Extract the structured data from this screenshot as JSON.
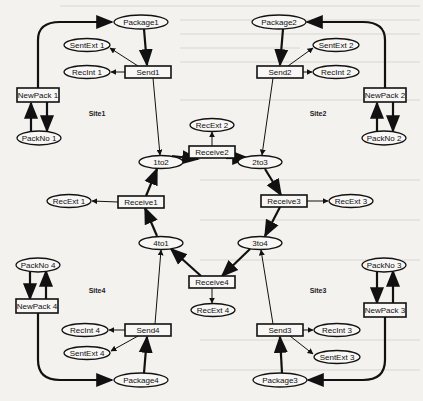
{
  "diagram": {
    "type": "petri-net",
    "colors": {
      "background": "#f4f2ef",
      "ink": "#111111"
    },
    "sites": [
      {
        "id": "site1",
        "label": "Site1",
        "x": 97,
        "y": 113
      },
      {
        "id": "site2",
        "label": "Site2",
        "x": 318,
        "y": 113
      },
      {
        "id": "site3",
        "label": "Site3",
        "x": 318,
        "y": 290
      },
      {
        "id": "site4",
        "label": "Site4",
        "x": 97,
        "y": 290
      }
    ],
    "places": [
      {
        "id": "package1",
        "label": "Package1",
        "x": 141,
        "y": 22,
        "rx": 27
      },
      {
        "id": "package2",
        "label": "Package2",
        "x": 279,
        "y": 22,
        "rx": 27
      },
      {
        "id": "package3",
        "label": "Package3",
        "x": 280,
        "y": 380,
        "rx": 27
      },
      {
        "id": "package4",
        "label": "Package4",
        "x": 141,
        "y": 380,
        "rx": 27
      },
      {
        "id": "sentext1",
        "label": "SentExt 1",
        "x": 87,
        "y": 45,
        "rx": 23
      },
      {
        "id": "recint1",
        "label": "RecInt 1",
        "x": 87,
        "y": 72,
        "rx": 23
      },
      {
        "id": "sentext2",
        "label": "SentExt 2",
        "x": 336,
        "y": 45,
        "rx": 23
      },
      {
        "id": "recint2",
        "label": "RecInt 2",
        "x": 336,
        "y": 72,
        "rx": 23
      },
      {
        "id": "packno1",
        "label": "PackNo 1",
        "x": 39,
        "y": 138,
        "rx": 22
      },
      {
        "id": "packno2",
        "label": "PackNo 2",
        "x": 384,
        "y": 138,
        "rx": 22
      },
      {
        "id": "recext2",
        "label": "RecExt 2",
        "x": 212,
        "y": 125,
        "rx": 22
      },
      {
        "id": "p1to2",
        "label": "1to2",
        "x": 161,
        "y": 162,
        "rx": 22
      },
      {
        "id": "p2to3",
        "label": "2to3",
        "x": 260,
        "y": 162,
        "rx": 22
      },
      {
        "id": "recext1",
        "label": "RecExt 1",
        "x": 69,
        "y": 201,
        "rx": 22
      },
      {
        "id": "recext3",
        "label": "RecExt 3",
        "x": 351,
        "y": 201,
        "rx": 22
      },
      {
        "id": "p4to1",
        "label": "4to1",
        "x": 161,
        "y": 243,
        "rx": 22
      },
      {
        "id": "p3to4",
        "label": "3to4",
        "x": 260,
        "y": 243,
        "rx": 22
      },
      {
        "id": "recext4",
        "label": "RecExt 4",
        "x": 213,
        "y": 310,
        "rx": 22
      },
      {
        "id": "packno4",
        "label": "PackNo 4",
        "x": 38,
        "y": 265,
        "rx": 22
      },
      {
        "id": "packno3",
        "label": "PackNo 3",
        "x": 384,
        "y": 265,
        "rx": 22
      },
      {
        "id": "recint4",
        "label": "RecInt 4",
        "x": 85,
        "y": 330,
        "rx": 23
      },
      {
        "id": "sentext4",
        "label": "SentExt 4",
        "x": 87,
        "y": 353,
        "rx": 23
      },
      {
        "id": "recint3",
        "label": "RecInt 3",
        "x": 337,
        "y": 330,
        "rx": 23
      },
      {
        "id": "sentext3",
        "label": "SentExt 3",
        "x": 337,
        "y": 357,
        "rx": 23
      }
    ],
    "transitions": [
      {
        "id": "send1",
        "label": "Send1",
        "x": 148,
        "y": 72,
        "w": 46
      },
      {
        "id": "send2",
        "label": "Send2",
        "x": 280,
        "y": 72,
        "w": 46
      },
      {
        "id": "send3",
        "label": "Send3",
        "x": 280,
        "y": 330,
        "w": 46
      },
      {
        "id": "send4",
        "label": "Send4",
        "x": 148,
        "y": 330,
        "w": 46
      },
      {
        "id": "newpack1",
        "label": "NewPack 1",
        "x": 38,
        "y": 95,
        "w": 42
      },
      {
        "id": "newpack2",
        "label": "NewPack 2",
        "x": 385,
        "y": 95,
        "w": 42
      },
      {
        "id": "newpack3",
        "label": "NewPack 3",
        "x": 385,
        "y": 310,
        "w": 42
      },
      {
        "id": "newpack4",
        "label": "NewPack 4",
        "x": 37,
        "y": 306,
        "w": 42
      },
      {
        "id": "receive1",
        "label": "Receive1",
        "x": 141,
        "y": 202,
        "w": 46
      },
      {
        "id": "receive2",
        "label": "Receive2",
        "x": 212,
        "y": 152,
        "w": 46
      },
      {
        "id": "receive3",
        "label": "Receive3",
        "x": 284,
        "y": 201,
        "w": 46
      },
      {
        "id": "receive4",
        "label": "Receive4",
        "x": 212,
        "y": 282,
        "w": 46
      }
    ]
  }
}
